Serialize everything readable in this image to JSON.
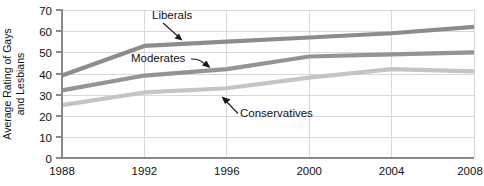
{
  "chart_data": {
    "type": "line",
    "title": "",
    "xlabel": "",
    "ylabel": "Average Rating of Gays and Lesbians",
    "ylabel_line1": "Average Rating of Gays",
    "ylabel_line2": "and Lesbians",
    "x": [
      1988,
      1992,
      1996,
      2000,
      2004,
      2008
    ],
    "categories": [
      "1988",
      "1992",
      "1996",
      "2000",
      "2004",
      "2008"
    ],
    "xlim": [
      1988,
      2008
    ],
    "ylim": [
      0,
      70
    ],
    "yticks": [
      70,
      60,
      50,
      40,
      30,
      20,
      10,
      0
    ],
    "ytick_labels": [
      "70",
      "60",
      "50",
      "40",
      "30",
      "20",
      "10",
      "0"
    ],
    "xticks": [
      1988,
      1992,
      1996,
      2000,
      2004,
      2008
    ],
    "xtick_labels": [
      "1988",
      "1992",
      "1996",
      "2000",
      "2004",
      "2008"
    ],
    "grid": "both",
    "legend_position": "inline-annotations",
    "series": [
      {
        "name": "Liberals",
        "color": "#8c8c8c",
        "values": [
          39,
          53,
          55,
          57,
          59,
          62
        ]
      },
      {
        "name": "Moderates",
        "color": "#949494",
        "values": [
          32,
          39,
          42,
          48,
          49,
          50
        ]
      },
      {
        "name": "Conservatives",
        "color": "#c4c4c4",
        "values": [
          25,
          31,
          33,
          38,
          42,
          41
        ]
      }
    ],
    "annotations": [
      {
        "text": "Liberals",
        "target_series": "Liberals"
      },
      {
        "text": "Moderates",
        "target_series": "Moderates"
      },
      {
        "text": "Conservatives",
        "target_series": "Conservatives"
      }
    ]
  },
  "colors": {
    "liberals": "#8c8c8c",
    "moderates": "#949494",
    "conservatives": "#c4c4c4",
    "gridline": "#d9d9dd",
    "axis": "#8a8a8a",
    "text": "#111111",
    "background": "#ffffff"
  }
}
